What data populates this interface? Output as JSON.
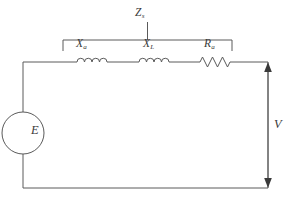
{
  "diagram": {
    "title_visible": false,
    "type": "electrical-circuit-schematic",
    "stroke_color": "#5a5a5a",
    "label_color": "#3a3a3a",
    "background_color": "#ffffff",
    "labels": {
      "source": {
        "symbol": "E",
        "subscript": ""
      },
      "reactance_armature": {
        "symbol": "X",
        "subscript": "a"
      },
      "reactance_leakage": {
        "symbol": "X",
        "subscript": "L"
      },
      "resistance_armature": {
        "symbol": "R",
        "subscript": "a"
      },
      "impedance_synchronous": {
        "symbol": "Z",
        "subscript": "s"
      },
      "terminal_voltage": {
        "symbol": "V",
        "subscript": ""
      }
    },
    "components": [
      {
        "name": "voltage-source",
        "kind": "ac-source-circle",
        "label": "E"
      },
      {
        "name": "inductor-xa",
        "kind": "inductor-coil",
        "label": "Xa"
      },
      {
        "name": "inductor-xl",
        "kind": "inductor-coil",
        "label": "XL"
      },
      {
        "name": "resistor-ra",
        "kind": "resistor-zigzag",
        "label": "Ra"
      }
    ],
    "annotations": [
      {
        "name": "impedance-bracket",
        "label": "Zs",
        "spans": [
          "Xa",
          "XL",
          "Ra"
        ]
      },
      {
        "name": "voltage-arrow",
        "label": "V",
        "style": "double-headed-vertical"
      }
    ]
  }
}
